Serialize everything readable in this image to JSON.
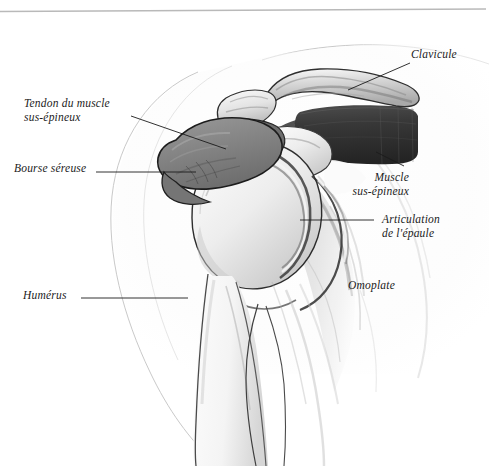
{
  "figure": {
    "language": "fr",
    "style": "pencil-shaded anatomical illustration, grayscale",
    "top_rule_color": "#b9b9b9",
    "ink_color": "#1b1b1b",
    "bursa_color": "#8a8a8a",
    "muscle_dark_color": "#3a3a3a",
    "bone_light_color": "#f2f2f2",
    "outline_faint_color": "#c8c8c8"
  },
  "labels": [
    {
      "id": "tendon",
      "name": "tendon-du-muscle-sus-epineux",
      "line1": "Tendon du muscle",
      "line2": "sus-épineux",
      "x": 24,
      "y": 96,
      "align": "left",
      "leader": {
        "x1": 131,
        "y1": 116,
        "x2": 226,
        "y2": 149
      }
    },
    {
      "id": "bourse",
      "name": "bourse-sereuse",
      "line1": "Bourse séreuse",
      "line2": "",
      "x": 14,
      "y": 161,
      "align": "left",
      "leader": {
        "x1": 96,
        "y1": 172,
        "x2": 196,
        "y2": 172
      }
    },
    {
      "id": "humerus",
      "name": "humerus",
      "line1": "Humérus",
      "line2": "",
      "x": 23,
      "y": 288,
      "align": "left",
      "leader": {
        "x1": 81,
        "y1": 298,
        "x2": 188,
        "y2": 298
      }
    },
    {
      "id": "clavicule",
      "name": "clavicule",
      "line1": "Clavicule",
      "line2": "",
      "x": 411,
      "y": 47,
      "align": "left",
      "leader": {
        "x1": 410,
        "y1": 63,
        "x2": 348,
        "y2": 90
      }
    },
    {
      "id": "muscle",
      "name": "muscle-sus-epineux",
      "line1": "Muscle",
      "line2": "sus-épineux",
      "x": 409,
      "y": 170,
      "align": "right",
      "leader": {
        "x1": 404,
        "y1": 166,
        "x2": 376,
        "y2": 152
      }
    },
    {
      "id": "articulation",
      "name": "articulation-de-l-epaule",
      "line1": "Articulation",
      "line2": "de l'épaule",
      "x": 382,
      "y": 212,
      "align": "left",
      "leader": {
        "x1": 300,
        "y1": 220,
        "x2": 374,
        "y2": 220
      }
    },
    {
      "id": "omoplate",
      "name": "omoplate",
      "line1": "Omoplate",
      "line2": "",
      "x": 348,
      "y": 278,
      "align": "left",
      "leader": null
    }
  ]
}
